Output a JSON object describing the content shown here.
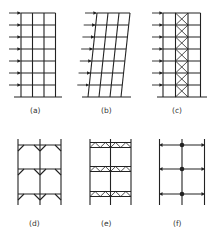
{
  "figure": {
    "panels": [
      {
        "id": "a",
        "label": "(a)",
        "description": "rigid frame under lateral load",
        "stories": 7,
        "bays": 3
      },
      {
        "id": "b",
        "label": "(b)",
        "description": "frame sway deformation",
        "stories": 7,
        "bays": 3
      },
      {
        "id": "c",
        "label": "(c)",
        "description": "braced frame with X-bracing in middle bay",
        "stories": 7,
        "bays": 3
      },
      {
        "id": "d",
        "label": "(d)",
        "description": "knee-braced frame",
        "stories": 3,
        "bays": 2
      },
      {
        "id": "e",
        "label": "(e)",
        "description": "truss-girder frame",
        "stories": 3,
        "bays": 2
      },
      {
        "id": "f",
        "label": "(f)",
        "description": "frame with rigid/pinned joints",
        "stories": 3,
        "bays": 2
      }
    ],
    "line_color": "#222222",
    "background": "#ffffff"
  }
}
